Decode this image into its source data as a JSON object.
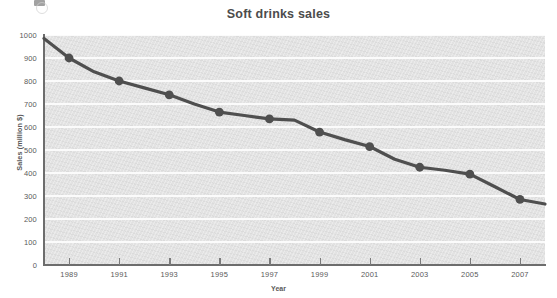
{
  "chart_data": {
    "type": "line",
    "title": "Soft drinks sales",
    "xlabel": "Year",
    "ylabel": "Sales (million $)",
    "xlim": [
      1988,
      2008
    ],
    "ylim": [
      0,
      1000
    ],
    "grid": true,
    "legend": "none",
    "x_tick_labels": [
      "1989",
      "1991",
      "1993",
      "1995",
      "1997",
      "1999",
      "2001",
      "2003",
      "2005",
      "2007"
    ],
    "x_tick_values": [
      1989,
      1991,
      1993,
      1995,
      1997,
      1999,
      2001,
      2003,
      2005,
      2007
    ],
    "y_tick_labels": [
      "0",
      "100",
      "200",
      "300",
      "400",
      "500",
      "600",
      "700",
      "800",
      "900",
      "1000"
    ],
    "y_tick_values": [
      0,
      100,
      200,
      300,
      400,
      500,
      600,
      700,
      800,
      900,
      1000
    ],
    "series": [
      {
        "name": "Soft drinks sales",
        "line_color": "#4f4f4f",
        "marker": "circle",
        "marker_color": "#4f4f4f",
        "x": [
          1988,
          1989,
          1990,
          1991,
          1992,
          1993,
          1994,
          1995,
          1996,
          1997,
          1998,
          1999,
          2000,
          2001,
          2002,
          2003,
          2004,
          2005,
          2006,
          2007,
          2008
        ],
        "values": [
          985,
          900,
          840,
          800,
          770,
          740,
          700,
          665,
          650,
          635,
          630,
          578,
          545,
          515,
          460,
          425,
          412,
          395,
          340,
          285,
          265
        ],
        "marker_x": [
          1989,
          1991,
          1993,
          1995,
          1997,
          1999,
          2001,
          2003,
          2005,
          2007
        ],
        "marker_values": [
          900,
          800,
          740,
          665,
          635,
          578,
          515,
          425,
          395,
          285
        ]
      }
    ]
  },
  "style": {
    "plot_background": "#e4e4e4",
    "gridline_color": "#fbfbfb",
    "axis_color": "#6d6d6d",
    "text_color": "#5a5a5a",
    "title_color": "#4c4c4c",
    "page_background": "#ffffff"
  }
}
